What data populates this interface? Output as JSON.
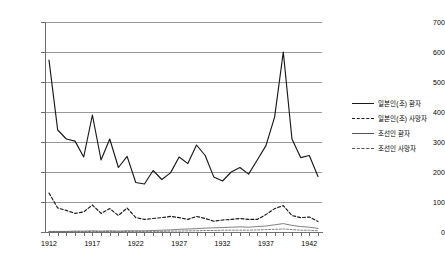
{
  "chart_data": {
    "type": "line",
    "title": "",
    "xlabel": "",
    "ylabel": "",
    "ylim": [
      0,
      700
    ],
    "ytick_values": [
      0,
      100,
      200,
      300,
      400,
      500,
      600,
      700
    ],
    "ytick_labels": [
      "0",
      "100",
      "200",
      "300",
      "400",
      "500",
      "600",
      "700"
    ],
    "grid": true,
    "legend_position": "right",
    "x": [
      1912,
      1913,
      1914,
      1915,
      1916,
      1917,
      1918,
      1919,
      1920,
      1921,
      1922,
      1923,
      1924,
      1925,
      1926,
      1927,
      1928,
      1929,
      1930,
      1931,
      1932,
      1933,
      1934,
      1935,
      1936,
      1937,
      1938,
      1939,
      1940,
      1941,
      1942,
      1943
    ],
    "xtick_labels": [
      "1912",
      "1917",
      "1922",
      "1927",
      "1932",
      "1937",
      "1942"
    ],
    "xtick_values": [
      1912,
      1917,
      1922,
      1927,
      1932,
      1937,
      1942
    ],
    "series": [
      {
        "name": "일본인(조) 환자",
        "style": "solid",
        "width": "thick",
        "color": "#1a1a1a",
        "values": [
          573,
          340,
          310,
          303,
          250,
          390,
          240,
          310,
          215,
          252,
          165,
          160,
          205,
          175,
          197,
          250,
          228,
          290,
          255,
          183,
          170,
          200,
          215,
          193,
          240,
          288,
          383,
          600,
          310,
          248,
          255,
          185
        ]
      },
      {
        "name": "일본인(조) 사망자",
        "style": "dashed",
        "width": "thick",
        "color": "#1a1a1a",
        "values": [
          130,
          80,
          72,
          62,
          67,
          90,
          62,
          78,
          55,
          80,
          48,
          42,
          45,
          48,
          52,
          48,
          42,
          52,
          45,
          36,
          40,
          42,
          45,
          42,
          42,
          58,
          78,
          88,
          55,
          48,
          50,
          35
        ]
      },
      {
        "name": "조선인 환자",
        "style": "solid",
        "width": "thin",
        "color": "#555555",
        "values": [
          2,
          2,
          2,
          3,
          3,
          4,
          3,
          4,
          3,
          4,
          4,
          4,
          5,
          6,
          7,
          9,
          10,
          11,
          13,
          14,
          15,
          16,
          17,
          16,
          18,
          20,
          24,
          28,
          22,
          18,
          16,
          12
        ]
      },
      {
        "name": "조선인 사망자",
        "style": "dashed",
        "width": "thin",
        "color": "#555555",
        "values": [
          1,
          1,
          1,
          1,
          1,
          2,
          1,
          2,
          1,
          2,
          2,
          2,
          2,
          2,
          3,
          3,
          4,
          4,
          5,
          5,
          6,
          6,
          6,
          6,
          7,
          8,
          9,
          10,
          8,
          6,
          6,
          4
        ]
      }
    ]
  },
  "legend": {
    "items": [
      {
        "label": "일본인(조) 환자"
      },
      {
        "label": "일본인(조) 사망자"
      },
      {
        "label": "조선인 환자"
      },
      {
        "label": "조선인 사망자"
      }
    ]
  }
}
